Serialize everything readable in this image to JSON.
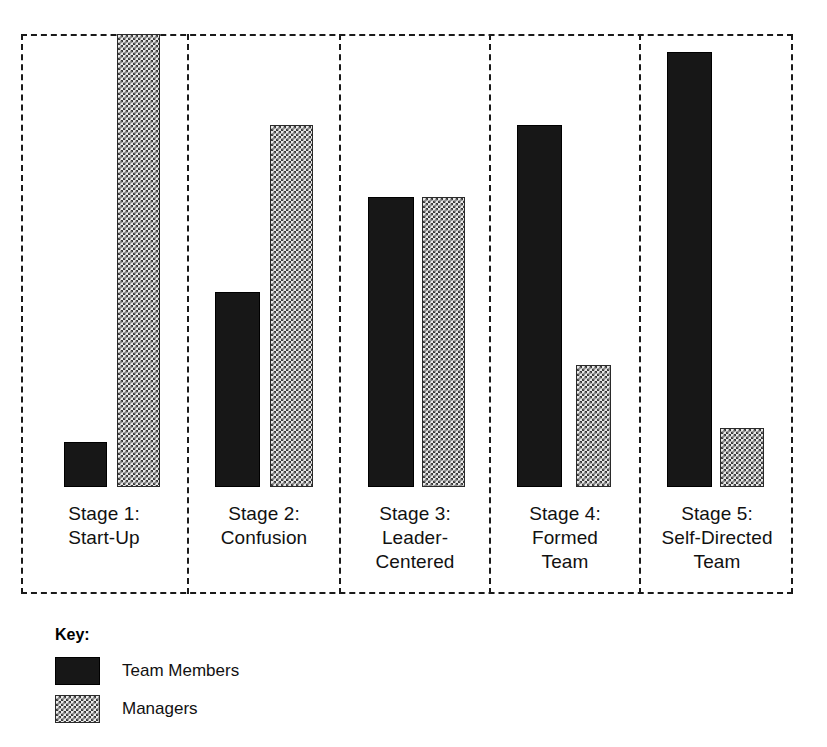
{
  "chart_data": {
    "type": "bar",
    "title": "",
    "subtitle": "",
    "xlabel": "",
    "ylabel": "",
    "ylim": [
      0,
      100
    ],
    "grid": false,
    "legend_position": "bottom-left",
    "legend_title": "Key:",
    "categories": [
      "Stage 1: Start-Up",
      "Stage 2: Confusion",
      "Stage 3: Leader-Centered",
      "Stage 4: Formed Team",
      "Stage 5: Self-Directed Team"
    ],
    "series": [
      {
        "name": "Team Members",
        "values": [
          10,
          43,
          64,
          80,
          96
        ],
        "color": "#171717",
        "pattern": "solid-black"
      },
      {
        "name": "Managers",
        "values": [
          100,
          80,
          64,
          27,
          13
        ],
        "color": "#e8e8e8",
        "pattern": "checkered-stipple"
      }
    ]
  },
  "frame": {
    "border_style": "dashed",
    "border_color": "#1a1a1a"
  },
  "stages": [
    {
      "id": "stage-1",
      "lines": [
        "Stage 1:",
        "Start-Up"
      ],
      "bars": [
        {
          "series": "Team Members",
          "value": 10
        },
        {
          "series": "Managers",
          "value": 100
        }
      ]
    },
    {
      "id": "stage-2",
      "lines": [
        "Stage 2:",
        "Confusion"
      ],
      "bars": [
        {
          "series": "Team Members",
          "value": 43
        },
        {
          "series": "Managers",
          "value": 80
        }
      ]
    },
    {
      "id": "stage-3",
      "lines": [
        "Stage 3:",
        "Leader-",
        "Centered"
      ],
      "bars": [
        {
          "series": "Team Members",
          "value": 64
        },
        {
          "series": "Managers",
          "value": 64
        }
      ]
    },
    {
      "id": "stage-4",
      "lines": [
        "Stage 4:",
        "Formed",
        "Team"
      ],
      "bars": [
        {
          "series": "Team Members",
          "value": 80
        },
        {
          "series": "Managers",
          "value": 27
        }
      ]
    },
    {
      "id": "stage-5",
      "lines": [
        "Stage 5:",
        "Self-Directed",
        "Team"
      ],
      "bars": [
        {
          "series": "Team Members",
          "value": 96
        },
        {
          "series": "Managers",
          "value": 13
        }
      ]
    }
  ],
  "key": {
    "title": "Key:",
    "items": [
      {
        "label": "Team Members",
        "swatch": "solid-black-swatch"
      },
      {
        "label": "Managers",
        "swatch": "stippled-swatch"
      }
    ]
  }
}
